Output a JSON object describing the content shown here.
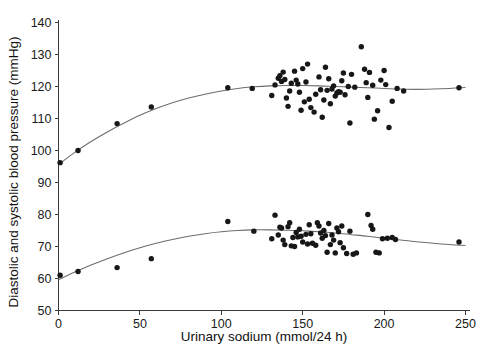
{
  "chart_data": {
    "type": "scatter",
    "title": "",
    "xlabel": "Urinary sodium  (mmol/24 h)",
    "ylabel": "Diastolic and systolic blood pressure (mmHg)",
    "xlim": [
      0,
      250
    ],
    "ylim": [
      50,
      140
    ],
    "xticks": [
      0,
      50,
      100,
      150,
      200,
      250
    ],
    "yticks": [
      50,
      60,
      70,
      80,
      90,
      100,
      110,
      120,
      130,
      140
    ],
    "xtick_labels": [
      "0",
      "50",
      "100",
      "150",
      "200",
      "250"
    ],
    "ytick_labels": [
      "50",
      "60",
      "70",
      "80",
      "90",
      "100",
      "110",
      "120",
      "130",
      "140"
    ],
    "grid": false,
    "legend": false,
    "legend_position": "none",
    "marker_color": "#171717",
    "curve_color": "#6d6d6d",
    "background_color": "#ffffff",
    "axis_color": "#3a3a3a",
    "series": [
      {
        "name": "Systolic blood pressure",
        "marker": "filled-circle",
        "points": [
          [
            1,
            96.2
          ],
          [
            12,
            100.0
          ],
          [
            36,
            108.4
          ],
          [
            57,
            113.6
          ],
          [
            104,
            119.6
          ],
          [
            119,
            119.4
          ],
          [
            131,
            117.2
          ],
          [
            133,
            120.5
          ],
          [
            135,
            122.6
          ],
          [
            136,
            123.4
          ],
          [
            137,
            121.6
          ],
          [
            138,
            124.5
          ],
          [
            139,
            122.2
          ],
          [
            140,
            116.4
          ],
          [
            141,
            113.8
          ],
          [
            142,
            118.6
          ],
          [
            143,
            121.0
          ],
          [
            145,
            124.8
          ],
          [
            146,
            122.0
          ],
          [
            147,
            120.8
          ],
          [
            148,
            118.2
          ],
          [
            149,
            112.6
          ],
          [
            150,
            125.6
          ],
          [
            151,
            115.2
          ],
          [
            152,
            121.4
          ],
          [
            153,
            127.0
          ],
          [
            154,
            116.0
          ],
          [
            155,
            113.4
          ],
          [
            157,
            112.0
          ],
          [
            158,
            117.6
          ],
          [
            160,
            123.0
          ],
          [
            161,
            119.0
          ],
          [
            162,
            110.4
          ],
          [
            163,
            115.8
          ],
          [
            164,
            126.0
          ],
          [
            165,
            118.8
          ],
          [
            166,
            122.4
          ],
          [
            167,
            114.6
          ],
          [
            168,
            119.2
          ],
          [
            169,
            120.2
          ],
          [
            170,
            117.0
          ],
          [
            171,
            118.0
          ],
          [
            172,
            118.4
          ],
          [
            173,
            118.2
          ],
          [
            174,
            121.8
          ],
          [
            175,
            124.2
          ],
          [
            176,
            117.4
          ],
          [
            178,
            120.0
          ],
          [
            179,
            108.6
          ],
          [
            180,
            123.8
          ],
          [
            182,
            119.8
          ],
          [
            186,
            132.4
          ],
          [
            188,
            125.4
          ],
          [
            189,
            121.2
          ],
          [
            190,
            116.6
          ],
          [
            191,
            124.4
          ],
          [
            193,
            120.4
          ],
          [
            194,
            109.8
          ],
          [
            196,
            112.4
          ],
          [
            198,
            122.0
          ],
          [
            200,
            125.0
          ],
          [
            201,
            120.6
          ],
          [
            203,
            107.2
          ],
          [
            205,
            115.4
          ],
          [
            208,
            119.4
          ],
          [
            212,
            118.6
          ],
          [
            246,
            119.6
          ]
        ]
      },
      {
        "name": "Diastolic blood pressure",
        "marker": "filled-circle",
        "points": [
          [
            1,
            61.0
          ],
          [
            12,
            62.2
          ],
          [
            36,
            63.4
          ],
          [
            57,
            66.2
          ],
          [
            104,
            77.8
          ],
          [
            120,
            74.8
          ],
          [
            131,
            72.4
          ],
          [
            133,
            79.8
          ],
          [
            135,
            73.6
          ],
          [
            136,
            76.0
          ],
          [
            137,
            75.8
          ],
          [
            138,
            72.0
          ],
          [
            139,
            70.6
          ],
          [
            141,
            76.2
          ],
          [
            142,
            77.4
          ],
          [
            143,
            70.2
          ],
          [
            144,
            72.8
          ],
          [
            145,
            70.0
          ],
          [
            146,
            74.4
          ],
          [
            147,
            73.0
          ],
          [
            148,
            75.4
          ],
          [
            149,
            73.2
          ],
          [
            150,
            71.4
          ],
          [
            152,
            73.8
          ],
          [
            153,
            70.8
          ],
          [
            154,
            76.8
          ],
          [
            155,
            74.0
          ],
          [
            156,
            71.0
          ],
          [
            158,
            70.4
          ],
          [
            159,
            77.4
          ],
          [
            160,
            76.4
          ],
          [
            161,
            74.2
          ],
          [
            162,
            72.6
          ],
          [
            163,
            75.0
          ],
          [
            164,
            73.4
          ],
          [
            165,
            68.2
          ],
          [
            166,
            77.2
          ],
          [
            167,
            70.6
          ],
          [
            168,
            73.6
          ],
          [
            169,
            72.0
          ],
          [
            170,
            68.0
          ],
          [
            171,
            75.8
          ],
          [
            172,
            74.6
          ],
          [
            173,
            71.2
          ],
          [
            174,
            76.4
          ],
          [
            175,
            69.6
          ],
          [
            177,
            67.8
          ],
          [
            179,
            74.8
          ],
          [
            181,
            67.6
          ],
          [
            183,
            68.0
          ],
          [
            190,
            80.0
          ],
          [
            192,
            76.6
          ],
          [
            193,
            75.4
          ],
          [
            195,
            68.2
          ],
          [
            197,
            68.0
          ],
          [
            199,
            72.4
          ],
          [
            202,
            72.6
          ],
          [
            205,
            72.8
          ],
          [
            207,
            72.2
          ],
          [
            246,
            71.4
          ]
        ]
      }
    ],
    "fit_curves": [
      {
        "name": "Systolic fitted curve",
        "for_series": "Systolic blood pressure",
        "points": [
          [
            0,
            95.6
          ],
          [
            10,
            99.4
          ],
          [
            20,
            102.8
          ],
          [
            30,
            105.8
          ],
          [
            40,
            108.5
          ],
          [
            50,
            111.0
          ],
          [
            60,
            113.1
          ],
          [
            70,
            114.9
          ],
          [
            80,
            116.4
          ],
          [
            90,
            117.6
          ],
          [
            100,
            118.6
          ],
          [
            110,
            119.4
          ],
          [
            120,
            119.9
          ],
          [
            130,
            120.2
          ],
          [
            140,
            120.3
          ],
          [
            150,
            120.3
          ],
          [
            160,
            120.2
          ],
          [
            170,
            120.0
          ],
          [
            180,
            119.8
          ],
          [
            190,
            119.6
          ],
          [
            200,
            119.4
          ],
          [
            210,
            119.2
          ],
          [
            220,
            119.1
          ],
          [
            230,
            119.2
          ],
          [
            240,
            119.4
          ],
          [
            250,
            119.7
          ]
        ]
      },
      {
        "name": "Diastolic fitted curve",
        "for_series": "Diastolic blood pressure",
        "points": [
          [
            0,
            59.6
          ],
          [
            10,
            62.0
          ],
          [
            20,
            64.2
          ],
          [
            30,
            66.2
          ],
          [
            40,
            68.0
          ],
          [
            50,
            69.6
          ],
          [
            60,
            71.0
          ],
          [
            70,
            72.2
          ],
          [
            80,
            73.2
          ],
          [
            90,
            74.0
          ],
          [
            100,
            74.6
          ],
          [
            110,
            75.0
          ],
          [
            120,
            75.2
          ],
          [
            130,
            75.2
          ],
          [
            140,
            75.1
          ],
          [
            150,
            74.9
          ],
          [
            160,
            74.6
          ],
          [
            170,
            74.2
          ],
          [
            180,
            73.7
          ],
          [
            190,
            73.2
          ],
          [
            200,
            72.6
          ],
          [
            210,
            72.0
          ],
          [
            220,
            71.5
          ],
          [
            230,
            71.0
          ],
          [
            240,
            70.6
          ],
          [
            250,
            70.3
          ]
        ]
      }
    ]
  },
  "axes": {
    "x_title": "Urinary sodium  (mmol/24 h)",
    "y_title": "Diastolic and systolic blood pressure (mmHg)"
  }
}
